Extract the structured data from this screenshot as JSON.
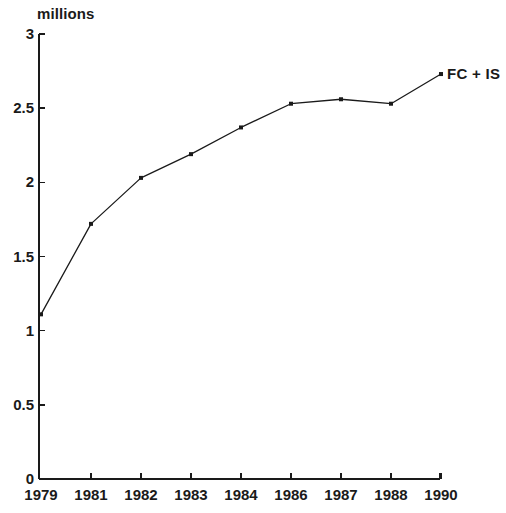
{
  "chart_data": {
    "type": "line",
    "title": "",
    "subtitle": "",
    "xlabel": "",
    "ylabel": "millions",
    "categories": [
      "1979",
      "1981",
      "1982",
      "1983",
      "1984",
      "1986",
      "1987",
      "1988",
      "1990"
    ],
    "series": [
      {
        "name": "FC + IS",
        "values": [
          1.11,
          1.72,
          2.03,
          2.19,
          2.37,
          2.53,
          2.56,
          2.53,
          2.73
        ]
      }
    ],
    "ylim": [
      0,
      3
    ],
    "ytick_labels": [
      "0",
      "0.5",
      "1",
      "1.5",
      "2",
      "2.5",
      "3"
    ],
    "ytick_values": [
      0,
      0.5,
      1,
      1.5,
      2,
      2.5,
      3
    ],
    "grid": false,
    "legend_position": "inline-right-end",
    "marker": "square",
    "line_color": "#1a1a1a",
    "marker_color": "#1a1a1a",
    "axis_color": "#1a1a1a",
    "background_color": "#ffffff"
  },
  "annotations": {
    "unit_label": "millions",
    "series_end_label": "FC + IS"
  }
}
